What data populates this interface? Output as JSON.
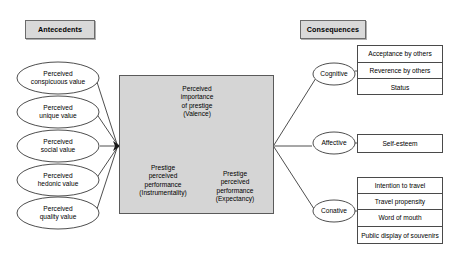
{
  "diagram": {
    "headers": {
      "left": "Antecedents",
      "right": "Consequences"
    },
    "antecedents": [
      {
        "line1": "Perceived",
        "line2": "conspicuous value"
      },
      {
        "line1": "Perceived",
        "line2": "unique value"
      },
      {
        "line1": "Perceived",
        "line2": "social value"
      },
      {
        "line1": "Perceived",
        "line2": "hedonic value"
      },
      {
        "line1": "Perceived",
        "line2": "quality value"
      }
    ],
    "core": {
      "valence": {
        "line1": "Perceived",
        "line2": "importance",
        "line3": "of prestige",
        "line4": "(Valence)"
      },
      "instrumentality": {
        "line1": "Prestige",
        "line2": "perceived",
        "line3": "performance",
        "line4": "(Instrumentality)"
      },
      "expectancy": {
        "line1": "Prestige",
        "line2": "perceived",
        "line3": "performance",
        "line4": "(Expectancy)"
      }
    },
    "consequences": [
      {
        "category": "Cognitive",
        "items": [
          "Acceptance by others",
          "Reverence by others",
          "Status"
        ]
      },
      {
        "category": "Affective",
        "items": [
          "Self-esteem"
        ]
      },
      {
        "category": "Conative",
        "items": [
          "Intention to travel",
          "Travel propensity",
          "Word of mouth",
          "Public display of souvenirs"
        ]
      }
    ]
  }
}
